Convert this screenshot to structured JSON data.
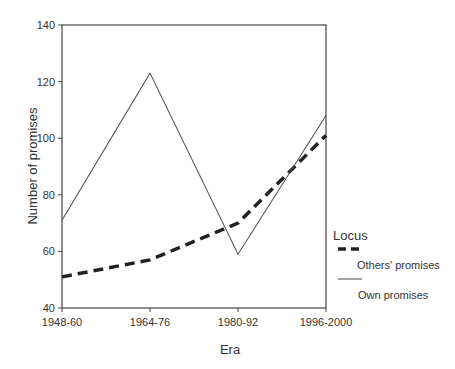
{
  "chart_data": {
    "type": "line",
    "title": "",
    "xlabel": "Era",
    "ylabel": "Number of promises",
    "categories": [
      "1948-60",
      "1964-76",
      "1980-92",
      "1996-2000"
    ],
    "ylim": [
      40,
      140
    ],
    "yticks": [
      40,
      60,
      80,
      100,
      120,
      140
    ],
    "grid": false,
    "legend": {
      "title": "Locus",
      "position": "right"
    },
    "series": [
      {
        "name": "Others' promises",
        "style": "dashed",
        "values": [
          51,
          57,
          70,
          101
        ]
      },
      {
        "name": "Own promises",
        "style": "solid",
        "values": [
          71,
          123,
          59,
          108
        ]
      }
    ]
  },
  "labels": {
    "xlabel": "Era",
    "ylabel": "Number of promises",
    "legend_title": "Locus",
    "legend_others": "Others' promises",
    "legend_own": "Own promises"
  }
}
